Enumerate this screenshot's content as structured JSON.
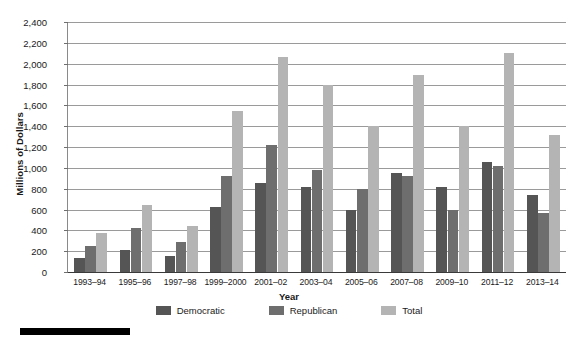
{
  "chart_data": {
    "type": "bar",
    "title": "",
    "xlabel": "Year",
    "ylabel": "Millions of Dollars",
    "ylim": [
      0,
      2400
    ],
    "ytick_step": 200,
    "grid": true,
    "legend_position": "bottom",
    "categories": [
      "1993–94",
      "1995–96",
      "1997–98",
      "1999–2000",
      "2001–02",
      "2003–04",
      "2005–06",
      "2007–08",
      "2009–10",
      "2011–12",
      "2013–14"
    ],
    "ytick_labels": [
      "0",
      "200",
      "400",
      "600",
      "800",
      "1,000",
      "1,200",
      "1,400",
      "1,600",
      "1,800",
      "2,000",
      "2,200",
      "2,400"
    ],
    "series": [
      {
        "name": "Democratic",
        "color": "#555555",
        "values": [
          130,
          215,
          155,
          625,
          855,
          820,
          595,
          950,
          820,
          1055,
          740
        ]
      },
      {
        "name": "Republican",
        "color": "#6e6e6e",
        "values": [
          245,
          420,
          285,
          925,
          1215,
          980,
          800,
          925,
          595,
          1020,
          570
        ]
      },
      {
        "name": "Total",
        "color": "#b4b4b4",
        "values": [
          375,
          640,
          445,
          1550,
          2060,
          1800,
          1400,
          1890,
          1400,
          2100,
          1320
        ]
      }
    ]
  },
  "legend": {
    "items": [
      {
        "label": "Democratic",
        "color": "#555555"
      },
      {
        "label": "Republican",
        "color": "#6e6e6e"
      },
      {
        "label": "Total",
        "color": "#b4b4b4"
      }
    ]
  }
}
